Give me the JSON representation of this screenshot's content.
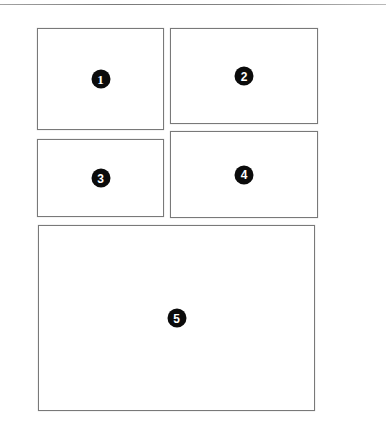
{
  "figure": {
    "background_color": "#ffffff",
    "rule_color": "#7d7d7d",
    "panel_border_color": "#6e6e6e",
    "badge_background_color": "#0b0b0b",
    "badge_text_color": "#ffffff",
    "canvas": {
      "width": 386,
      "height": 438
    }
  },
  "page_rule": {
    "name": "top-horizontal-rule",
    "present": true
  },
  "panels": [
    {
      "id": "panel-1",
      "badge_label": "1",
      "x": 37,
      "y": 28,
      "width": 127,
      "height": 102
    },
    {
      "id": "panel-2",
      "badge_label": "2",
      "x": 170,
      "y": 28,
      "width": 148,
      "height": 96
    },
    {
      "id": "panel-3",
      "badge_label": "3",
      "x": 37,
      "y": 139,
      "width": 127,
      "height": 78
    },
    {
      "id": "panel-4",
      "badge_label": "4",
      "x": 170,
      "y": 131,
      "width": 148,
      "height": 87
    },
    {
      "id": "panel-5",
      "badge_label": "5",
      "x": 38,
      "y": 225,
      "width": 277,
      "height": 186
    }
  ]
}
